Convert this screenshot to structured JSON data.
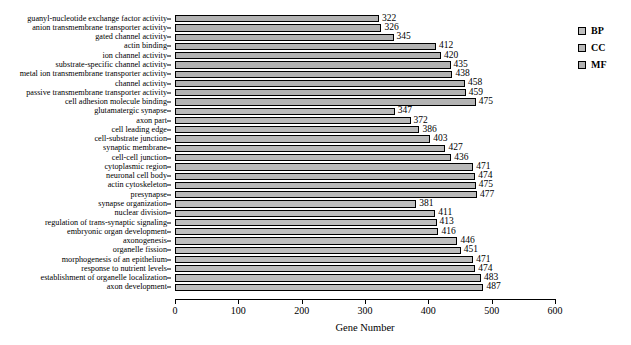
{
  "chart_data": {
    "type": "bar",
    "orientation": "horizontal",
    "title": "",
    "xlabel": "Gene Number",
    "ylabel": "",
    "xlim": [
      0,
      600
    ],
    "xticks": [
      0,
      100,
      200,
      300,
      400,
      500,
      600
    ],
    "grid": false,
    "legend_position": "right-top",
    "legend": [
      {
        "key": "BP",
        "label": "BP",
        "color": "#bfbfbf"
      },
      {
        "key": "CC",
        "label": "CC",
        "color": "#b9b9b9"
      },
      {
        "key": "MF",
        "label": "MF",
        "color": "#b3b3b3"
      }
    ],
    "categories": [
      "guanyl-nucleotide exchange factor activity",
      "anion transmembrane transporter activity",
      "gated channel activity",
      "actin binding",
      "ion channel activity",
      "substrate-specific channel activity",
      "metal ion transmembrane transporter activity",
      "channel activity",
      "passive transmembrane transporter activity",
      "cell adhesion molecule binding",
      "glutamatergic synapse",
      "axon part",
      "cell leading edge",
      "cell-substrate junction",
      "synaptic membrane",
      "cell-cell junction",
      "cytoplasmic region",
      "neuronal cell body",
      "actin cytoskeleton",
      "presynapse",
      "synapse organization",
      "nuclear division",
      "regulation of trans-synaptic signaling",
      "embryonic organ development",
      "axonogenesis",
      "organelle fission",
      "morphogenesis of an epithelium",
      "response to nutrient levels",
      "establishment of organelle localization",
      "axon development"
    ],
    "values": [
      322,
      326,
      345,
      412,
      420,
      435,
      438,
      458,
      459,
      475,
      347,
      372,
      386,
      403,
      427,
      436,
      471,
      474,
      475,
      477,
      381,
      411,
      413,
      416,
      446,
      451,
      471,
      474,
      483,
      487
    ],
    "groups": [
      "MF",
      "MF",
      "MF",
      "MF",
      "MF",
      "MF",
      "MF",
      "MF",
      "MF",
      "MF",
      "CC",
      "CC",
      "CC",
      "CC",
      "CC",
      "CC",
      "CC",
      "CC",
      "CC",
      "CC",
      "BP",
      "BP",
      "BP",
      "BP",
      "BP",
      "BP",
      "BP",
      "BP",
      "BP",
      "BP"
    ]
  }
}
